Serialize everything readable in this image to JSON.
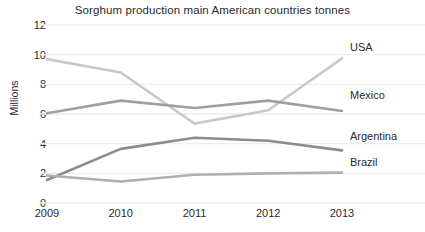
{
  "chart_data": {
    "type": "line",
    "title": "Sorghum production main American countries tonnes",
    "xlabel": "",
    "ylabel": "Millions",
    "categories": [
      "2009",
      "2010",
      "2011",
      "2012",
      "2013"
    ],
    "ylim": [
      0,
      12
    ],
    "ytick_step": 2,
    "yticks": [
      "12",
      "10",
      "8",
      "6",
      "4",
      "2",
      "0"
    ],
    "grid": "horizontal",
    "legend_position": "inline-right",
    "series": [
      {
        "name": "USA",
        "color": "#c9c9c9",
        "values": [
          9.7,
          8.8,
          5.35,
          6.25,
          9.75
        ],
        "label_y": 10.55
      },
      {
        "name": "Mexico",
        "color": "#a0a0a0",
        "values": [
          6.05,
          6.9,
          6.4,
          6.9,
          6.2
        ],
        "label_y": 7.3
      },
      {
        "name": "Argentina",
        "color": "#8c8c8c",
        "values": [
          1.55,
          3.65,
          4.4,
          4.2,
          3.55
        ],
        "label_y": 4.55
      },
      {
        "name": "Brazil",
        "color": "#b0b0b0",
        "values": [
          1.85,
          1.45,
          1.9,
          2.0,
          2.05
        ],
        "label_y": 2.75
      }
    ]
  },
  "colors": {
    "background": "#ffffff",
    "gridline": "#ededed",
    "text": "#2b2b2b"
  }
}
